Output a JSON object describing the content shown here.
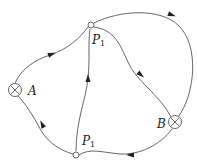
{
  "diagram": {
    "type": "directed-flow-network",
    "nodes": [
      {
        "id": "A",
        "label": "A",
        "subscript": "",
        "symbol": "crossed-circle"
      },
      {
        "id": "B",
        "label": "B",
        "subscript": "",
        "symbol": "crossed-circle"
      },
      {
        "id": "P1_top",
        "label": "P",
        "subscript": "1",
        "symbol": "open-circle"
      },
      {
        "id": "P1_bottom",
        "label": "P",
        "subscript": "1",
        "symbol": "open-circle"
      }
    ],
    "edges": [
      {
        "from": "A",
        "to": "P1_top",
        "direction": "forward"
      },
      {
        "from": "P1_top",
        "to": "B",
        "direction": "forward",
        "route": "outer-arc"
      },
      {
        "from": "P1_top",
        "to": "B",
        "direction": "forward",
        "route": "inner"
      },
      {
        "from": "B",
        "to": "P1_bottom",
        "direction": "forward"
      },
      {
        "from": "P1_bottom",
        "to": "A",
        "direction": "forward"
      },
      {
        "from": "P1_bottom",
        "to": "P1_top",
        "direction": "forward"
      }
    ]
  }
}
